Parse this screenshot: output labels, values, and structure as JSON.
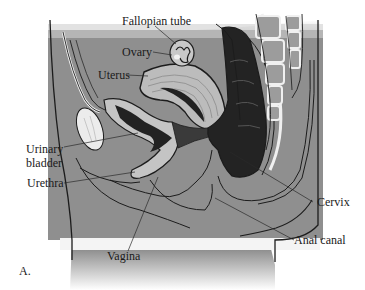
{
  "figure": {
    "panel_label": "A.",
    "colors": {
      "background": "#ffffff",
      "tissue": "#8e8e8e",
      "tissue_light": "#a6a6a6",
      "organ_light": "#bdbdbd",
      "organ_dark": "#2a2a2a",
      "bone": "#9c9c9c",
      "bone_gap": "#f0f0f0",
      "outline": "#1c1c1c"
    }
  },
  "labels": [
    {
      "id": "fallopian-tube",
      "text": "Fallopian tube"
    },
    {
      "id": "ovary",
      "text": "Ovary"
    },
    {
      "id": "uterus",
      "text": "Uterus"
    },
    {
      "id": "urinary-bladder-line1",
      "text": "Urinary"
    },
    {
      "id": "urinary-bladder-line2",
      "text": "bladder"
    },
    {
      "id": "urethra",
      "text": "Urethra"
    },
    {
      "id": "vagina",
      "text": "Vagina"
    },
    {
      "id": "cervix",
      "text": "Cervix"
    },
    {
      "id": "anal-canal",
      "text": "Anal canal"
    }
  ]
}
